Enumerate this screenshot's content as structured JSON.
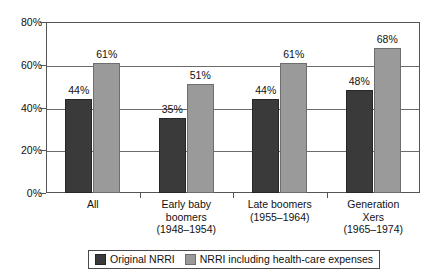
{
  "chart_data": {
    "type": "bar",
    "title": "",
    "subtitle": "",
    "xlabel": "",
    "ylabel": "",
    "ylim": [
      0,
      80
    ],
    "yticks": [
      "0%",
      "20%",
      "40%",
      "60%",
      "80%"
    ],
    "ytick_values": [
      0,
      20,
      40,
      60,
      80
    ],
    "grid": true,
    "legend_position": "bottom",
    "categories": [
      {
        "lines": [
          "All"
        ]
      },
      {
        "lines": [
          "Early baby",
          "boomers",
          "(1948–1954)"
        ]
      },
      {
        "lines": [
          "Late boomers",
          "(1955–1964)"
        ]
      },
      {
        "lines": [
          "Generation",
          "Xers",
          "(1965–1974)"
        ]
      }
    ],
    "series": [
      {
        "name": "Original NRRI",
        "color": "#3a3a3a",
        "values": [
          44,
          35,
          44,
          48
        ],
        "labels": [
          "44%",
          "35%",
          "44%",
          "48%"
        ]
      },
      {
        "name": "NRRI including health-care expenses",
        "color": "#9a9a9a",
        "values": [
          61,
          51,
          61,
          68
        ],
        "labels": [
          "61%",
          "51%",
          "61%",
          "68%"
        ]
      }
    ]
  }
}
